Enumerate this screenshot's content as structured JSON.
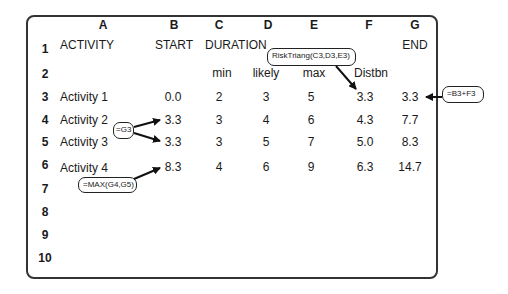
{
  "columns": [
    "A",
    "B",
    "C",
    "D",
    "E",
    "F",
    "G"
  ],
  "rows": [
    "1",
    "2",
    "3",
    "4",
    "5",
    "6",
    "7",
    "8",
    "9",
    "10"
  ],
  "header_row1": {
    "activity": "ACTIVITY",
    "start": "START",
    "duration": "DURATION",
    "end": "END"
  },
  "header_row2": {
    "min": "min",
    "likely": "likely",
    "max": "max",
    "distbn": "Distbn"
  },
  "data_rows": [
    {
      "activity": "Activity 1",
      "start": "0.0",
      "min": "2",
      "likely": "3",
      "max": "5",
      "distbn": "3.3",
      "end": "3.3"
    },
    {
      "activity": "Activity 2",
      "start": "3.3",
      "min": "3",
      "likely": "4",
      "max": "6",
      "distbn": "4.3",
      "end": "7.7"
    },
    {
      "activity": "Activity 3",
      "start": "3.3",
      "min": "3",
      "likely": "5",
      "max": "7",
      "distbn": "5.0",
      "end": "8.3"
    },
    {
      "activity": "Activity 4",
      "start": "8.3",
      "min": "4",
      "likely": "6",
      "max": "9",
      "distbn": "6.3",
      "end": "14.7"
    }
  ],
  "annotations": {
    "risk_triang": "RiskTriang(C3,D3,E3)",
    "end_formula": "=B3+F3",
    "g3_ref": "=G3",
    "max_formula": "=MAX(G4,G5)"
  }
}
